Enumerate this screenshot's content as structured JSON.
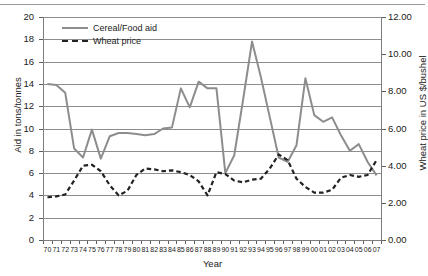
{
  "chart_data": {
    "type": "line",
    "title": "",
    "xlabel": "Year",
    "ylabel": "Aid in tons/tonnes",
    "y2label": "Wheat price in US $/bushel",
    "ylim": [
      0,
      20
    ],
    "y2lim": [
      0,
      12
    ],
    "yticks": [
      "0",
      "2",
      "4",
      "6",
      "8",
      "10",
      "12",
      "14",
      "16",
      "18",
      "20"
    ],
    "y2ticks": [
      "0.00",
      "2.00",
      "4.00",
      "6.00",
      "8.00",
      "10.00",
      "12.00"
    ],
    "grid": "horizontal",
    "legend_position": "top-left-inside",
    "categories": [
      "70",
      "71",
      "72",
      "73",
      "74",
      "75",
      "76",
      "77",
      "78",
      "79",
      "80",
      "81",
      "82",
      "83",
      "84",
      "85",
      "86",
      "87",
      "88",
      "89",
      "90",
      "91",
      "92",
      "93",
      "94",
      "95",
      "96",
      "97",
      "98",
      "99",
      "00",
      "01",
      "02",
      "03",
      "04",
      "05",
      "06",
      "07"
    ],
    "series": [
      {
        "name": "Cereal/Food aid",
        "axis": "left",
        "style": "solid",
        "color": "#8d8d8d",
        "values": [
          14.0,
          13.9,
          13.2,
          8.2,
          7.4,
          9.9,
          7.3,
          9.3,
          9.6,
          9.6,
          9.5,
          9.4,
          9.5,
          10.0,
          10.1,
          13.6,
          11.9,
          14.2,
          13.6,
          13.6,
          6.0,
          7.6,
          12.6,
          17.8,
          14.6,
          11.0,
          7.4,
          7.0,
          8.5,
          14.5,
          11.2,
          10.6,
          11.0,
          9.4,
          8.0,
          8.6,
          7.0,
          5.8
        ]
      },
      {
        "name": "Wheat price",
        "axis": "right",
        "style": "dashed",
        "color": "#222222",
        "values": [
          2.3,
          2.35,
          2.45,
          3.2,
          4.0,
          4.05,
          3.7,
          2.95,
          2.4,
          2.65,
          3.5,
          3.85,
          3.8,
          3.7,
          3.75,
          3.65,
          3.5,
          3.15,
          2.4,
          3.65,
          3.55,
          3.2,
          3.1,
          3.25,
          3.3,
          3.85,
          4.6,
          4.3,
          3.3,
          2.85,
          2.55,
          2.55,
          2.7,
          3.35,
          3.5,
          3.4,
          3.5,
          4.3
        ]
      }
    ]
  },
  "legend": {
    "items": [
      {
        "label": "Cereal/Food aid",
        "style": "solid"
      },
      {
        "label": "Wheat price",
        "style": "dashed"
      }
    ]
  }
}
